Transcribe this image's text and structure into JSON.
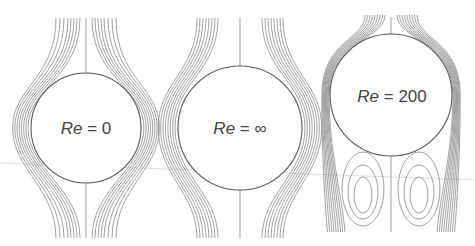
{
  "figure": {
    "panels": [
      {
        "id": "stokes",
        "re_symbol": "Re",
        "equals": "=",
        "value": "0",
        "center": [
          86,
          128
        ],
        "radius": 55
      },
      {
        "id": "potential",
        "re_symbol": "Re",
        "equals": "=",
        "value": "∞",
        "center": [
          240,
          128
        ],
        "radius": 62
      },
      {
        "id": "wake",
        "re_symbol": "Re",
        "equals": "=",
        "value": "200",
        "center": [
          391,
          95
        ],
        "radius": 61
      }
    ],
    "line_color": "#7a7a7a",
    "circle_color": "#555555"
  }
}
